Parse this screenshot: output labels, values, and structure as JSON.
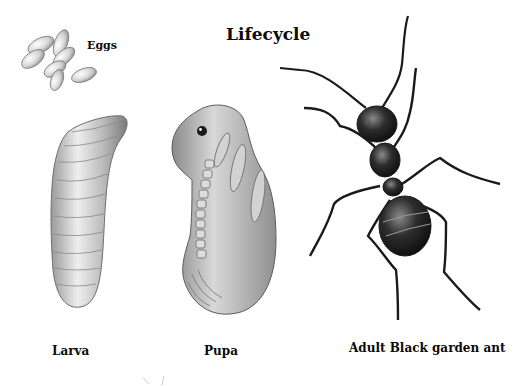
{
  "diagram": {
    "title": "Lifecycle",
    "stages": [
      {
        "id": "eggs",
        "label": "Eggs"
      },
      {
        "id": "larva",
        "label": "Larva"
      },
      {
        "id": "pupa",
        "label": "Pupa"
      },
      {
        "id": "adult",
        "label": "Adult Black garden ant"
      }
    ]
  },
  "colors": {
    "background": "#ffffff",
    "text": "#0a0a0a",
    "egg_fill": "#d9d9d9",
    "larva_fill": "#cfcfcf",
    "pupa_fill": "#bdbdbd",
    "ant_body": "#1e1e1e"
  }
}
